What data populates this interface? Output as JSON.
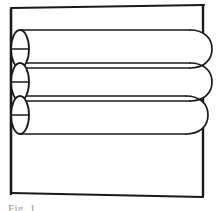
{
  "figure": {
    "caption": "Fig. 1",
    "background_color": "#ffffff",
    "line_color": "#1a1a1a",
    "fill_color": "#ffffff",
    "canvas": {
      "width": 220,
      "height": 211
    },
    "frame": {
      "label": "outer-enclosure",
      "x": 10,
      "y": 5,
      "width": 193,
      "height": 191,
      "stroke_width": 2
    },
    "tube_rows": [
      {
        "index": 1,
        "label": "tube-row-top",
        "y_top": 30,
        "y_bottom": 68
      },
      {
        "index": 2,
        "label": "tube-row-middle",
        "y_top": 63,
        "y_bottom": 101
      },
      {
        "index": 3,
        "label": "tube-row-bottom",
        "y_top": 96,
        "y_bottom": 134
      }
    ],
    "tube_ends": [
      {
        "index": 1,
        "label": "tube-end-ellipse-top",
        "cx": 20,
        "cy": 49,
        "rx": 9,
        "ry": 19
      },
      {
        "index": 2,
        "label": "tube-end-ellipse-middle",
        "cx": 20,
        "cy": 82,
        "rx": 9,
        "ry": 19
      },
      {
        "index": 3,
        "label": "tube-end-ellipse-bottom",
        "cx": 20,
        "cy": 115,
        "rx": 9,
        "ry": 19
      }
    ],
    "bends": [
      {
        "index": 1,
        "label": "u-bend-upper-right",
        "cy": 49
      },
      {
        "index": 2,
        "label": "u-bend-lower-right",
        "cy": 82
      },
      {
        "index": 3,
        "label": "u-bend-bottom-right",
        "cy": 115
      }
    ],
    "geometry_notes": {
      "bend_extent_x": 212,
      "tube_left_x": 20,
      "tube_right_x": 196
    }
  }
}
